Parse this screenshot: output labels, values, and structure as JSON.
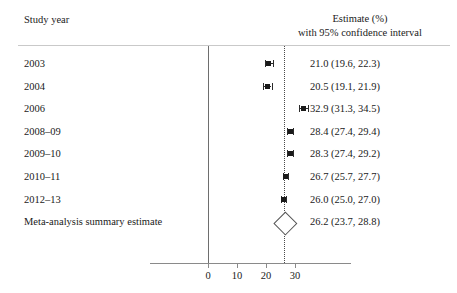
{
  "header": {
    "left_label": "Study year",
    "right_line1": "Estimate (%)",
    "right_line2": "with 95% confidence interval"
  },
  "chart_data": {
    "type": "forest",
    "title": "",
    "xlabel": "",
    "ylabel": "",
    "xlim": [
      -4,
      36
    ],
    "xticks": [
      0,
      10,
      20,
      30
    ],
    "xtick_labels": [
      "0",
      "10",
      "20",
      "30"
    ],
    "grid": false,
    "reference_line_solid_at": 0,
    "reference_line_dotted_at": 26.2,
    "column_headers": [
      "Study year",
      "Estimate (%) with 95% confidence interval"
    ],
    "rows": [
      {
        "label": "2003",
        "estimate": 21.0,
        "ci_low": 19.6,
        "ci_high": 22.3,
        "estimate_text": "21.0 (19.6, 22.3)",
        "marker": "square"
      },
      {
        "label": "2004",
        "estimate": 20.5,
        "ci_low": 19.1,
        "ci_high": 21.9,
        "estimate_text": "20.5 (19.1, 21.9)",
        "marker": "square"
      },
      {
        "label": "2006",
        "estimate": 32.9,
        "ci_low": 31.3,
        "ci_high": 34.5,
        "estimate_text": "32.9 (31.3, 34.5)",
        "marker": "square"
      },
      {
        "label": "2008–09",
        "estimate": 28.4,
        "ci_low": 27.4,
        "ci_high": 29.4,
        "estimate_text": "28.4 (27.4, 29.4)",
        "marker": "square"
      },
      {
        "label": "2009–10",
        "estimate": 28.3,
        "ci_low": 27.4,
        "ci_high": 29.2,
        "estimate_text": "28.3 (27.4, 29.2)",
        "marker": "square"
      },
      {
        "label": "2010–11",
        "estimate": 26.7,
        "ci_low": 25.7,
        "ci_high": 27.7,
        "estimate_text": "26.7 (25.7, 27.7)",
        "marker": "square"
      },
      {
        "label": "2012–13",
        "estimate": 26.0,
        "ci_low": 25.0,
        "ci_high": 27.0,
        "estimate_text": "26.0 (25.0, 27.0)",
        "marker": "square"
      },
      {
        "label": "Meta-analysis summary estimate",
        "estimate": 26.2,
        "ci_low": 23.7,
        "ci_high": 28.8,
        "estimate_text": "26.2 (23.7, 28.8)",
        "marker": "diamond"
      }
    ]
  },
  "colors": {
    "background": "#ffffff",
    "text": "#1a1a1a",
    "marker": "#1a1a1a",
    "rule": "#c9c9c9",
    "axis": "#8a8a8a",
    "solid_reference_line": "#6e6e6e",
    "dotted_reference_line": "#4a4a4a"
  }
}
